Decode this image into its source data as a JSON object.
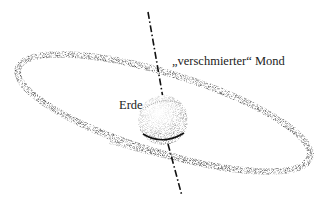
{
  "diagram": {
    "labels": {
      "moon": "„verschmierter“ Mond",
      "earth": "Erde"
    },
    "elements": [
      {
        "name": "rotation-axis",
        "style": "dash-dot"
      },
      {
        "name": "smeared-moon-ring",
        "shape": "tilted-ellipse",
        "style": "stippled"
      },
      {
        "name": "earth-sphere",
        "shape": "sphere",
        "style": "stippled"
      }
    ],
    "colors": {
      "ink": "#222222",
      "stipple": "#555555",
      "background": "#ffffff"
    }
  }
}
